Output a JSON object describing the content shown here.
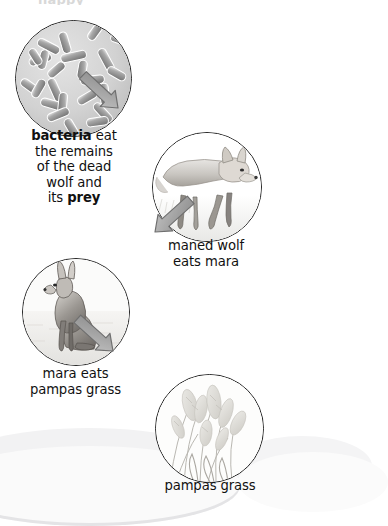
{
  "diagram": {
    "title_remnant": "happy",
    "type": "food-chain-cycle",
    "nodes": [
      {
        "id": "bacteria",
        "icon": "bacteria-rods-icon",
        "caption_parts": [
          {
            "text": "bacteria",
            "bold": true
          },
          {
            "text": " eat",
            "bold": false
          },
          {
            "text": "the remains",
            "bold": false
          },
          {
            "text": "of the dead",
            "bold": false
          },
          {
            "text": "wolf and",
            "bold": false
          },
          {
            "text": "its ",
            "bold": false
          },
          {
            "text": "prey",
            "bold": true
          }
        ],
        "caption_plain": "bacteria eat the remains of the dead wolf and its prey"
      },
      {
        "id": "maned-wolf",
        "icon": "maned-wolf-icon",
        "caption_line1": "maned wolf",
        "caption_line2": "eats mara"
      },
      {
        "id": "mara",
        "icon": "mara-icon",
        "caption_line1": "mara eats",
        "caption_line2": "pampas grass"
      },
      {
        "id": "pampas-grass",
        "icon": "pampas-grass-icon",
        "caption_line1": "pampas grass"
      }
    ],
    "arrows": [
      {
        "id": "arrow-wolf-to-bacteria",
        "from": "maned-wolf",
        "to": "bacteria",
        "direction": "up-left"
      },
      {
        "id": "arrow-mara-to-wolf",
        "from": "mara",
        "to": "maned-wolf",
        "direction": "up-right"
      },
      {
        "id": "arrow-grass-to-mara",
        "from": "pampas-grass",
        "to": "mara",
        "direction": "up-left"
      }
    ],
    "colors": {
      "outline": "#242424",
      "arrow_fill": "#a6a6a6",
      "arrow_stroke": "#6e6e6e",
      "text": "#111111",
      "background": "#ffffff"
    }
  }
}
